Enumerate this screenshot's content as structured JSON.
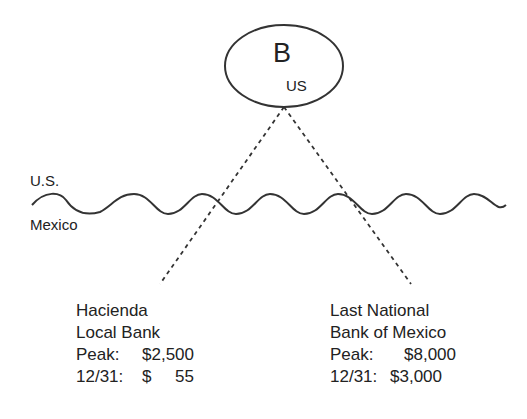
{
  "node": {
    "letter": "B",
    "location": "US"
  },
  "border": {
    "north_label": "U.S.",
    "south_label": "Mexico"
  },
  "banks": [
    {
      "name_line1": "Hacienda",
      "name_line2": "Local Bank",
      "peak_label": "Peak:",
      "peak_value": "$2,500",
      "year_end_label": "12/31:",
      "year_end_value": "$     55"
    },
    {
      "name_line1": "Last National",
      "name_line2": "Bank of Mexico",
      "peak_label": "Peak:",
      "peak_value": "$8,000",
      "year_end_label": "12/31:",
      "year_end_value": "$3,000"
    }
  ],
  "colors": {
    "stroke": "#333333",
    "text": "#222222",
    "background": "#ffffff"
  }
}
